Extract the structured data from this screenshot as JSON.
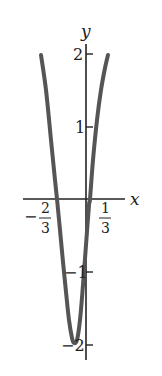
{
  "chart_data": {
    "type": "line",
    "title": "",
    "xlabel": "x",
    "ylabel": "y",
    "grid": false,
    "legend": null,
    "x_tick_labels": [
      {
        "value": -0.6667,
        "label_sign": "−",
        "num": "2",
        "den": "3"
      },
      {
        "value": 0.3333,
        "label_sign": "",
        "num": "1",
        "den": "3"
      }
    ],
    "y_tick_labels": [
      {
        "value": 2,
        "label": "2"
      },
      {
        "value": 1,
        "label": "1"
      },
      {
        "value": -1,
        "label": "−1"
      },
      {
        "value": -2,
        "label": "−2"
      }
    ],
    "ylim": [
      -2,
      2
    ],
    "series": [
      {
        "name": "curve",
        "color": "#555555",
        "points_px": [
          [
            41,
            55
          ],
          [
            46,
            90
          ],
          [
            51,
            140
          ],
          [
            55,
            180
          ],
          [
            57,
            199
          ],
          [
            60,
            230
          ],
          [
            63,
            262
          ],
          [
            66,
            292
          ],
          [
            69,
            320
          ],
          [
            72,
            338
          ],
          [
            74,
            343
          ],
          [
            77,
            340
          ],
          [
            80,
            320
          ],
          [
            83,
            285
          ],
          [
            86,
            245
          ],
          [
            89,
            205
          ],
          [
            90,
            199
          ],
          [
            93,
            160
          ],
          [
            97,
            120
          ],
          [
            101,
            90
          ],
          [
            105,
            68
          ],
          [
            108,
            55
          ]
        ]
      }
    ]
  },
  "colors": {
    "axis": "#222222",
    "curve": "#555555",
    "background": "#ffffff"
  }
}
